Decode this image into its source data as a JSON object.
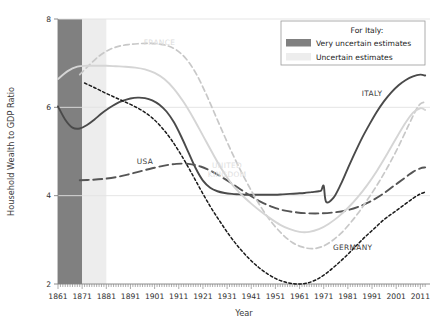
{
  "chart_data": {
    "type": "line",
    "title": "",
    "xlabel": "Year",
    "ylabel": "Household Wealth to GDP Ratio",
    "xlim": [
      1861,
      2015
    ],
    "ylim": [
      2,
      8
    ],
    "yticks": [
      2,
      4,
      6,
      8
    ],
    "xticks": [
      1861,
      1871,
      1881,
      1891,
      1901,
      1911,
      1921,
      1931,
      1941,
      1951,
      1961,
      1971,
      1981,
      1991,
      2001,
      2011
    ],
    "xtick_labels": [
      "1861",
      "1871",
      "1881",
      "1891",
      "1901",
      "1911",
      "1921",
      "1931",
      "1941",
      "1951",
      "1961",
      "1971",
      "1981",
      "1991",
      "2001",
      "2011"
    ],
    "grid": "horizontal",
    "grid_values": [
      4,
      6,
      8
    ],
    "legend_position": "top-right",
    "minor_ticks": "yearly",
    "series": [
      {
        "name": "ITALY",
        "style": "solid",
        "color": "#4a4a4a",
        "width": 1.9,
        "label_x": 1991,
        "label_y": 6.25,
        "x": [
          1861,
          1864,
          1867,
          1870,
          1873,
          1876,
          1879,
          1882,
          1885,
          1888,
          1891,
          1894,
          1897,
          1900,
          1903,
          1906,
          1909,
          1912,
          1915,
          1918,
          1921,
          1924,
          1927,
          1930,
          1933,
          1936,
          1939,
          1942,
          1945,
          1948,
          1951,
          1954,
          1957,
          1960,
          1963,
          1966,
          1969,
          1970,
          1971,
          1972,
          1975,
          1978,
          1981,
          1984,
          1987,
          1990,
          1993,
          1996,
          1999,
          2002,
          2005,
          2008,
          2011,
          2013
        ],
        "y": [
          6.02,
          5.72,
          5.54,
          5.52,
          5.6,
          5.72,
          5.86,
          5.98,
          6.08,
          6.15,
          6.2,
          6.22,
          6.21,
          6.16,
          6.06,
          5.9,
          5.66,
          5.34,
          4.98,
          4.62,
          4.34,
          4.18,
          4.1,
          4.06,
          4.04,
          4.03,
          4.02,
          4.02,
          4.02,
          4.02,
          4.02,
          4.03,
          4.04,
          4.05,
          4.06,
          4.08,
          4.1,
          4.12,
          4.22,
          3.86,
          3.95,
          4.25,
          4.62,
          4.98,
          5.32,
          5.62,
          5.9,
          6.14,
          6.34,
          6.5,
          6.62,
          6.7,
          6.74,
          6.72
        ]
      },
      {
        "name": "USA",
        "style": "long-dash",
        "color": "#555555",
        "width": 1.9,
        "label_x": 1897,
        "label_y": 4.72,
        "x": [
          1870,
          1875,
          1880,
          1885,
          1890,
          1895,
          1900,
          1905,
          1910,
          1915,
          1920,
          1925,
          1930,
          1935,
          1940,
          1945,
          1950,
          1955,
          1960,
          1965,
          1970,
          1975,
          1980,
          1985,
          1990,
          1995,
          2000,
          2005,
          2008,
          2011,
          2013
        ],
        "y": [
          4.35,
          4.36,
          4.38,
          4.42,
          4.48,
          4.55,
          4.62,
          4.68,
          4.72,
          4.72,
          4.66,
          4.54,
          4.38,
          4.2,
          4.02,
          3.86,
          3.74,
          3.66,
          3.62,
          3.6,
          3.6,
          3.62,
          3.66,
          3.74,
          3.86,
          4.02,
          4.22,
          4.42,
          4.54,
          4.62,
          4.64
        ]
      },
      {
        "name": "GERMANY",
        "style": "short-dash",
        "color": "#1a1a1a",
        "width": 1.5,
        "label_x": 1983,
        "label_y": 2.78,
        "x": [
          1872,
          1876,
          1880,
          1884,
          1888,
          1892,
          1896,
          1900,
          1904,
          1908,
          1912,
          1916,
          1920,
          1924,
          1928,
          1932,
          1936,
          1940,
          1944,
          1948,
          1952,
          1956,
          1960,
          1964,
          1968,
          1972,
          1976,
          1980,
          1984,
          1988,
          1992,
          1996,
          2000,
          2004,
          2008,
          2011,
          2013
        ],
        "y": [
          6.55,
          6.45,
          6.34,
          6.24,
          6.14,
          6.04,
          5.92,
          5.76,
          5.54,
          5.26,
          4.92,
          4.54,
          4.14,
          3.76,
          3.42,
          3.1,
          2.82,
          2.58,
          2.38,
          2.22,
          2.1,
          2.03,
          2.0,
          2.02,
          2.1,
          2.24,
          2.42,
          2.62,
          2.84,
          3.06,
          3.26,
          3.46,
          3.62,
          3.78,
          3.94,
          4.04,
          4.08
        ]
      },
      {
        "name": "FRANCE",
        "style": "dashed",
        "color": "#c8c8c8",
        "width": 1.7,
        "label_x": 1903,
        "label_y": 7.42,
        "x": [
          1870,
          1874,
          1878,
          1882,
          1886,
          1890,
          1894,
          1898,
          1902,
          1906,
          1910,
          1914,
          1918,
          1922,
          1926,
          1930,
          1934,
          1938,
          1942,
          1946,
          1950,
          1954,
          1958,
          1962,
          1966,
          1970,
          1974,
          1978,
          1982,
          1986,
          1990,
          1994,
          1998,
          2002,
          2006,
          2009,
          2011,
          2013
        ],
        "y": [
          6.74,
          6.96,
          7.16,
          7.3,
          7.38,
          7.42,
          7.44,
          7.45,
          7.44,
          7.4,
          7.3,
          7.1,
          6.78,
          6.34,
          5.84,
          5.34,
          4.86,
          4.42,
          4.02,
          3.66,
          3.36,
          3.12,
          2.94,
          2.84,
          2.8,
          2.84,
          2.96,
          3.14,
          3.38,
          3.66,
          3.98,
          4.32,
          4.7,
          5.12,
          5.58,
          5.92,
          6.08,
          6.12
        ]
      },
      {
        "name": "UNITED KINGDOM",
        "style": "solid",
        "color": "#d5d5d5",
        "width": 1.9,
        "label_x": 1931,
        "label_y": 4.62,
        "label_lines": [
          "UNITED",
          "KINGDOM"
        ],
        "x": [
          1861,
          1865,
          1869,
          1873,
          1877,
          1881,
          1885,
          1889,
          1893,
          1897,
          1901,
          1905,
          1909,
          1913,
          1917,
          1921,
          1925,
          1929,
          1933,
          1937,
          1941,
          1945,
          1949,
          1953,
          1957,
          1961,
          1965,
          1969,
          1973,
          1977,
          1981,
          1985,
          1989,
          1993,
          1997,
          2001,
          2005,
          2008,
          2011,
          2013
        ],
        "y": [
          6.64,
          6.82,
          6.92,
          6.94,
          6.94,
          6.94,
          6.93,
          6.92,
          6.9,
          6.86,
          6.78,
          6.64,
          6.42,
          6.12,
          5.76,
          5.36,
          4.96,
          4.58,
          4.26,
          4.02,
          3.82,
          3.64,
          3.48,
          3.34,
          3.24,
          3.18,
          3.18,
          3.24,
          3.36,
          3.52,
          3.72,
          3.96,
          4.24,
          4.56,
          4.92,
          5.3,
          5.66,
          5.88,
          5.98,
          5.94
        ]
      }
    ],
    "shaded_bands": [
      {
        "name": "very-uncertain",
        "label": "Very uncertain estimates",
        "x_start": 1861,
        "x_end": 1871,
        "color": "#808080"
      },
      {
        "name": "uncertain",
        "label": "Uncertain estimates",
        "x_start": 1871,
        "x_end": 1881,
        "color": "#ededed"
      }
    ]
  },
  "legend": {
    "title": "For Italy:",
    "items": [
      {
        "label": "Very uncertain estimates",
        "color": "#808080"
      },
      {
        "label": "Uncertain estimates",
        "color": "#ededed"
      }
    ]
  }
}
